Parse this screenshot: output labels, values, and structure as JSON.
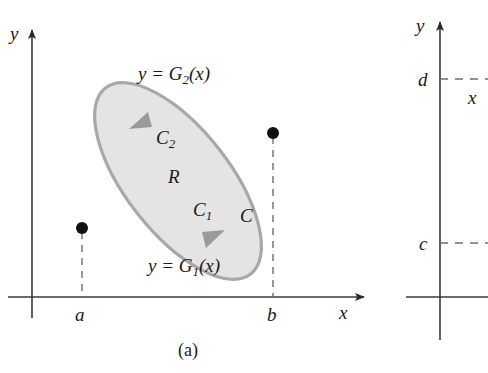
{
  "figure": {
    "caption": "(a)",
    "panel_a": {
      "axis_y_label": "y",
      "axis_x_label": "x",
      "lower_bound_label": "a",
      "upper_bound_label": "b",
      "region_label": "R",
      "curve_upper_label": "C",
      "curve_upper_sub": "2",
      "curve_lower_label": "C",
      "curve_lower_sub": "1",
      "curve_full_label": "C",
      "equation_upper_lhs": "y = G",
      "equation_upper_sub": "2",
      "equation_upper_rhs": "(x)",
      "equation_lower_lhs": "y = G",
      "equation_lower_sub": "1",
      "equation_lower_rhs": "(x)"
    },
    "panel_b": {
      "axis_y_label": "y",
      "upper_level_label": "d",
      "lower_level_label": "c",
      "variable_label": "x"
    },
    "colors": {
      "ink": "#1a1a1a",
      "axis": "#3a3a3a",
      "region_fill": "#e3e3e3",
      "region_stroke": "#9e9e9e",
      "dashed": "#6e6e6e",
      "dot": "#111111"
    }
  }
}
